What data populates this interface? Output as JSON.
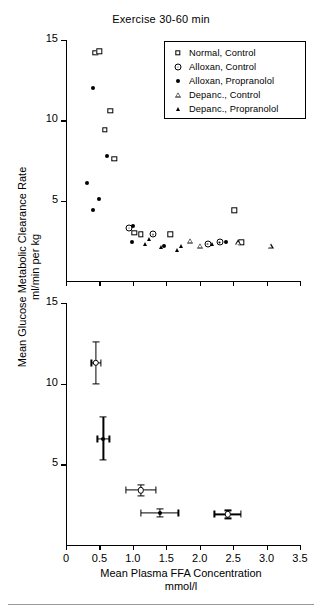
{
  "title": "Exercise 30-60 min",
  "axes": {
    "ylabel_line1": "Mean Glucose Metabolic Clearance Rate",
    "ylabel_line2": "ml/min per kg",
    "xlabel_line1": "Mean Plasma FFA Concentration",
    "xlabel_line2": "mmol/l",
    "xticks": [
      "0",
      "0.5",
      "1.0",
      "1.5",
      "2.0",
      "2.5",
      "3.0",
      "3.5"
    ],
    "yticks": [
      "15",
      "10",
      "5"
    ]
  },
  "legend": {
    "items": [
      {
        "label": "Normal, Control",
        "marker": "open-square"
      },
      {
        "label": "Alloxan, Control",
        "marker": "dotted-circle"
      },
      {
        "label": "Alloxan, Propranolol",
        "marker": "filled-circle"
      },
      {
        "label": "Depanc., Control",
        "marker": "open-triangle"
      },
      {
        "label": "Depanc., Propranolol",
        "marker": "filled-triangle"
      }
    ]
  },
  "chart_data": [
    {
      "type": "scatter",
      "panel": "upper",
      "title": "Exercise 30-60 min",
      "xlabel": "Mean Plasma FFA Concentration mmol/l",
      "ylabel": "Mean Glucose Metabolic Clearance Rate ml/min per kg",
      "xlim": [
        0,
        3.5
      ],
      "ylim": [
        0,
        15
      ],
      "grid": false,
      "legend_position": "top-right-inset",
      "series": [
        {
          "name": "Normal, Control",
          "marker": "open-square",
          "points": [
            [
              0.44,
              14.2
            ],
            [
              0.5,
              14.3
            ],
            [
              0.66,
              10.6
            ],
            [
              0.58,
              9.4
            ],
            [
              0.72,
              7.6
            ],
            [
              1.02,
              3.0
            ],
            [
              1.12,
              2.9
            ],
            [
              1.56,
              2.9
            ],
            [
              2.52,
              4.4
            ],
            [
              2.62,
              2.4
            ]
          ]
        },
        {
          "name": "Alloxan, Control",
          "marker": "dotted-circle",
          "points": [
            [
              0.94,
              3.3
            ],
            [
              1.3,
              2.9
            ],
            [
              2.12,
              2.3
            ],
            [
              2.3,
              2.4
            ]
          ]
        },
        {
          "name": "Alloxan, Propranolol",
          "marker": "filled-circle",
          "points": [
            [
              0.4,
              12.0
            ],
            [
              0.62,
              7.8
            ],
            [
              0.32,
              6.1
            ],
            [
              0.5,
              5.1
            ],
            [
              0.4,
              4.4
            ],
            [
              1.0,
              3.4
            ],
            [
              0.98,
              2.4
            ],
            [
              1.46,
              2.2
            ],
            [
              2.4,
              2.4
            ]
          ]
        },
        {
          "name": "Depanc., Control",
          "marker": "open-triangle",
          "points": [
            [
              1.86,
              2.5
            ],
            [
              2.0,
              2.2
            ],
            [
              2.58,
              2.4
            ],
            [
              3.06,
              2.2
            ]
          ]
        },
        {
          "name": "Depanc., Propranolol",
          "marker": "filled-triangle",
          "points": [
            [
              1.24,
              2.6
            ],
            [
              1.18,
              2.3
            ],
            [
              1.42,
              2.1
            ],
            [
              1.72,
              2.2
            ],
            [
              1.66,
              1.9
            ],
            [
              2.18,
              2.3
            ]
          ]
        }
      ]
    },
    {
      "type": "scatter",
      "panel": "lower",
      "xlabel": "Mean Plasma FFA Concentration mmol/l",
      "ylabel": "Mean Glucose Metabolic Clearance Rate ml/min per kg",
      "xlim": [
        0,
        3.5
      ],
      "ylim": [
        0,
        15
      ],
      "grid": false,
      "description": "Group means with SEM error bars in both axes",
      "points": [
        {
          "group": "Normal, Control",
          "marker": "open-circle",
          "x": 0.45,
          "y": 11.3,
          "x_err": 0.07,
          "y_err": 1.3
        },
        {
          "group": "Alloxan, Control",
          "marker": "filled-circle",
          "x": 0.56,
          "y": 6.6,
          "x_err": 0.09,
          "y_err": 1.35
        },
        {
          "group": "Alloxan, Propranolol",
          "marker": "open-circle",
          "x": 1.12,
          "y": 3.4,
          "x_err": 0.22,
          "y_err": 0.35
        },
        {
          "group": "Depanc., Control",
          "marker": "filled-circle",
          "x": 1.4,
          "y": 2.0,
          "x_err": 0.28,
          "y_err": 0.25
        },
        {
          "group": "Depanc., Propranolol",
          "marker": "open-circle",
          "x": 2.42,
          "y": 1.9,
          "x_err": 0.2,
          "y_err": 0.25
        }
      ]
    }
  ]
}
